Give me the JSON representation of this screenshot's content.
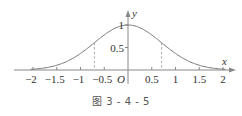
{
  "chart_data": {
    "type": "line",
    "title": "",
    "function": "y = e^(-x^2)",
    "xlabel": "x",
    "ylabel": "y",
    "origin_label": "O",
    "xlim": [
      -2.1,
      2.1
    ],
    "ylim": [
      0,
      1.2
    ],
    "grid": false,
    "legend": null,
    "x_ticks": [
      -2,
      -1.5,
      -1,
      -0.5,
      0.5,
      1,
      1.5,
      2
    ],
    "x_tick_labels": [
      "−2",
      "−1.5",
      "−1",
      "−0.5",
      "0.5",
      "1",
      "1.5",
      "2"
    ],
    "y_ticks": [
      0.5,
      1
    ],
    "y_tick_labels": [
      "0.5",
      "1"
    ],
    "series": [
      {
        "name": "curve",
        "x": [
          -2,
          -1.75,
          -1.5,
          -1.25,
          -1,
          -0.75,
          -0.5,
          -0.25,
          0,
          0.25,
          0.5,
          0.75,
          1,
          1.25,
          1.5,
          1.75,
          2
        ],
        "values": [
          0.018,
          0.047,
          0.105,
          0.21,
          0.368,
          0.57,
          0.779,
          0.939,
          1.0,
          0.939,
          0.779,
          0.57,
          0.368,
          0.21,
          0.105,
          0.047,
          0.018
        ]
      }
    ],
    "annotations": [
      {
        "type": "dashed-vertical",
        "x": -0.707,
        "y_top": 0.607
      },
      {
        "type": "dashed-vertical",
        "x": 0.707,
        "y_top": 0.607
      }
    ],
    "colors": {
      "curve": "#777777",
      "axis": "#888888",
      "text": "#333333"
    }
  },
  "caption": "图 3 - 4 - 5"
}
